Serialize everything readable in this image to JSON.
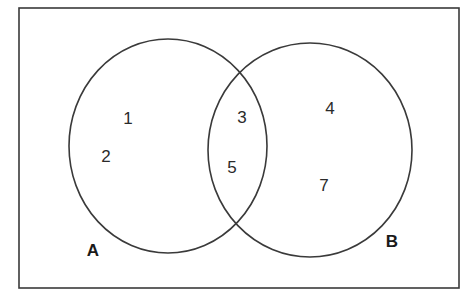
{
  "diagram": {
    "type": "venn",
    "sets": [
      {
        "name": "A",
        "label": "A"
      },
      {
        "name": "B",
        "label": "B"
      }
    ],
    "regions": {
      "only_a": [
        "1",
        "2"
      ],
      "a_and_b": [
        "3",
        "5"
      ],
      "only_b": [
        "4",
        "7"
      ]
    },
    "elements": {
      "e1": "1",
      "e2": "2",
      "e3": "3",
      "e4": "4",
      "e5": "5",
      "e7": "7"
    },
    "labels": {
      "set_a": "A",
      "set_b": "B"
    },
    "colors": {
      "stroke": "#3a3a3a",
      "text": "#2a2a2a",
      "background": "#ffffff"
    }
  }
}
